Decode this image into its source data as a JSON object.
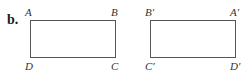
{
  "part_label": "b.",
  "figures": [
    {
      "name": "original",
      "vertices": {
        "top_left": "A",
        "top_right": "B",
        "bottom_left": "D",
        "bottom_right": "C"
      }
    },
    {
      "name": "image",
      "vertices": {
        "top_left": "B′",
        "top_right": "A′",
        "bottom_left": "C′",
        "bottom_right": "D′"
      }
    }
  ],
  "colors": {
    "stroke": "#555555",
    "text": "#333333"
  }
}
